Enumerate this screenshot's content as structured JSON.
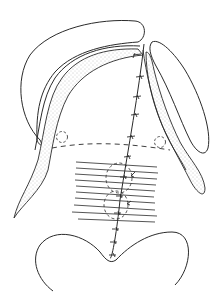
{
  "diagram": {
    "type": "surgical-illustration",
    "background": "#ffffff",
    "stroke_color": "#2a2a2a",
    "stipple_color": "#9a9a9a",
    "components": [
      "left-outer-flap",
      "right-outer-flap",
      "left-stippled-mucoperiosteal-flap",
      "right-stippled-mucoperiosteal-flap",
      "midline-suture-line",
      "dashed-transverse-line",
      "left-dashed-circle",
      "right-dashed-circle",
      "horizontal-hatched-region",
      "upper-dashed-oval",
      "lower-dashed-oval",
      "bottom-uvula-arc"
    ],
    "suture_count": 14
  }
}
